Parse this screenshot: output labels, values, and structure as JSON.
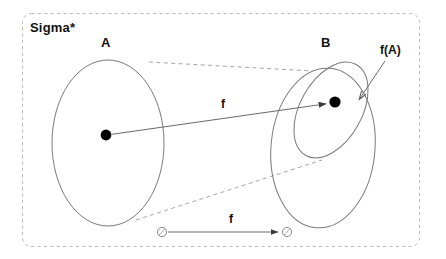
{
  "diagram": {
    "title": "Sigma*",
    "type": "set-function-mapping-diagram",
    "labels": {
      "universe": "Sigma*",
      "domain_set": "A",
      "codomain_set": "B",
      "image_set": "f(A)",
      "function_main": "f",
      "function_element": "f"
    },
    "shapes": {
      "outer_boundary": {
        "name": "universe-boundary",
        "style": "dashed-rounded-rectangle",
        "x": 22,
        "y": 13,
        "width": 398,
        "height": 234,
        "stroke": "#b9b9b9"
      },
      "ellipse_a": {
        "name": "set-a-ellipse",
        "cx": 108,
        "cy": 143,
        "rx": 56,
        "ry": 83,
        "rotation": 0,
        "stroke": "#777777"
      },
      "ellipse_b": {
        "name": "set-b-ellipse",
        "cx": 323,
        "cy": 148,
        "rx": 53,
        "ry": 80,
        "rotation": 4,
        "stroke": "#777777"
      },
      "ellipse_fa": {
        "name": "image-fa-ellipse",
        "cx": 331,
        "cy": 110,
        "rx": 32,
        "ry": 52,
        "rotation": 28,
        "stroke": "#777777"
      },
      "dot_a": {
        "name": "element-a-dot",
        "cx": 106,
        "cy": 135,
        "r": 5.5,
        "fill": "#000000"
      },
      "dot_fa": {
        "name": "element-fa-dot",
        "cx": 335,
        "cy": 102,
        "r": 5.5,
        "fill": "#000000"
      },
      "small_circle_left": {
        "name": "element-small-circle-left",
        "cx": 162,
        "cy": 232,
        "r": 5,
        "stroke": "#888888"
      },
      "small_circle_right": {
        "name": "element-small-circle-right",
        "cx": 287,
        "cy": 232,
        "r": 5,
        "stroke": "#888888"
      }
    },
    "connectors": {
      "arrow_main": {
        "name": "mapping-arrow-main",
        "from": [
          112,
          134
        ],
        "to": [
          329,
          103
        ],
        "stroke": "#666666"
      },
      "arrow_elements": {
        "name": "mapping-arrow-elements",
        "from": [
          168,
          232
        ],
        "to": [
          281,
          232
        ],
        "stroke": "#666666"
      },
      "arrow_fa_label": {
        "name": "fa-callout-arrow",
        "from": [
          384,
          62
        ],
        "to": [
          357,
          101
        ],
        "stroke": "#666666"
      },
      "dashed_top": {
        "name": "projection-line-top",
        "from": [
          149,
          62
        ],
        "to": [
          313,
          71
        ],
        "stroke": "#999999"
      },
      "dashed_bottom": {
        "name": "projection-line-bottom",
        "from": [
          136,
          220
        ],
        "to": [
          322,
          160
        ],
        "stroke": "#999999"
      }
    },
    "colors": {
      "background": "#ffffff",
      "outline": "#777777",
      "dashed": "#b0b0b0",
      "text": "#111111",
      "dot_fill": "#000000"
    }
  }
}
